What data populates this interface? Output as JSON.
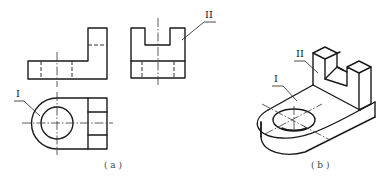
{
  "figure": {
    "panels": [
      {
        "id": "a",
        "caption": "( a )",
        "description": "Three orthographic views of a part",
        "views": [
          "front-view",
          "side-view",
          "top-view"
        ],
        "labels": [
          {
            "text": "I",
            "target": "cylindrical surface (rounded end) in top view"
          },
          {
            "text": "II",
            "target": "face of upright slotted block in side view"
          }
        ]
      },
      {
        "id": "b",
        "caption": "( b )",
        "description": "Isometric pictorial view of the part",
        "labels": [
          {
            "text": "I",
            "target": "top face of base plate near hole"
          },
          {
            "text": "II",
            "target": "front face of upright slotted block"
          }
        ]
      }
    ],
    "colors": {
      "line": "#1a1a1a",
      "background": "#ffffff"
    }
  }
}
